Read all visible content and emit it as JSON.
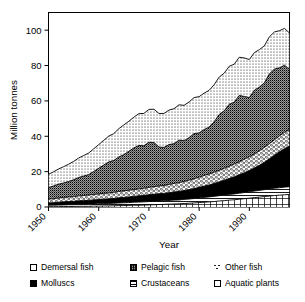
{
  "chart_data": {
    "type": "area",
    "title": "",
    "xlabel": "Year",
    "ylabel": "Million tonnes",
    "xlim": [
      1950,
      1998
    ],
    "ylim": [
      0,
      110
    ],
    "yticks": [
      0,
      20,
      40,
      60,
      80,
      100
    ],
    "xticks": [
      1950,
      1960,
      1970,
      1980,
      1990
    ],
    "grid": false,
    "legend_position": "below",
    "stacked": true,
    "stack_order_bottom_to_top": [
      "Aquatic plants",
      "Crustaceans",
      "Molluscs",
      "Other fish",
      "Pelagic fish",
      "Demersal fish"
    ],
    "x": [
      1950,
      1951,
      1952,
      1953,
      1954,
      1955,
      1956,
      1957,
      1958,
      1959,
      1960,
      1961,
      1962,
      1963,
      1964,
      1965,
      1966,
      1967,
      1968,
      1969,
      1970,
      1971,
      1972,
      1973,
      1974,
      1975,
      1976,
      1977,
      1978,
      1979,
      1980,
      1981,
      1982,
      1983,
      1984,
      1985,
      1986,
      1987,
      1988,
      1989,
      1990,
      1991,
      1992,
      1993,
      1994,
      1995,
      1996,
      1997,
      1998
    ],
    "series": [
      {
        "name": "Aquatic plants",
        "values": [
          0.2,
          0.2,
          0.2,
          0.3,
          0.3,
          0.3,
          0.4,
          0.4,
          0.4,
          0.5,
          0.5,
          0.6,
          0.6,
          0.7,
          0.8,
          0.8,
          0.9,
          1.0,
          1.0,
          1.1,
          1.2,
          1.3,
          1.4,
          1.5,
          1.6,
          1.7,
          1.8,
          2.0,
          2.1,
          2.3,
          2.5,
          2.7,
          2.9,
          3.1,
          3.4,
          3.6,
          3.9,
          4.1,
          4.4,
          4.7,
          5.0,
          5.3,
          5.6,
          5.9,
          6.2,
          6.5,
          6.7,
          6.9,
          7.1
        ]
      },
      {
        "name": "Crustaceans",
        "values": [
          0.8,
          0.8,
          0.9,
          0.9,
          1.0,
          1.0,
          1.1,
          1.1,
          1.2,
          1.2,
          1.3,
          1.3,
          1.4,
          1.4,
          1.5,
          1.6,
          1.6,
          1.7,
          1.8,
          1.8,
          1.9,
          1.9,
          2.0,
          2.0,
          2.1,
          2.2,
          2.2,
          2.3,
          2.4,
          2.5,
          2.6,
          2.7,
          2.8,
          2.9,
          3.0,
          3.1,
          3.2,
          3.3,
          3.4,
          3.5,
          3.6,
          3.7,
          3.8,
          3.9,
          4.0,
          4.1,
          4.2,
          4.3,
          4.4
        ]
      },
      {
        "name": "Molluscs",
        "values": [
          1.3,
          1.4,
          1.6,
          1.7,
          1.8,
          1.9,
          2.0,
          2.1,
          2.2,
          2.3,
          2.4,
          2.5,
          2.6,
          2.7,
          2.9,
          3.0,
          3.2,
          3.3,
          3.5,
          3.6,
          3.8,
          4.0,
          4.1,
          4.2,
          4.4,
          4.6,
          4.8,
          5.0,
          5.3,
          5.6,
          6.0,
          6.4,
          6.8,
          7.3,
          7.8,
          8.4,
          9.0,
          9.7,
          10.4,
          11.2,
          12.0,
          13.0,
          14.2,
          15.5,
          17.0,
          18.6,
          20.3,
          21.8,
          23.0
        ]
      },
      {
        "name": "Other fish",
        "values": [
          2.2,
          2.3,
          2.4,
          2.5,
          2.6,
          2.7,
          2.8,
          2.9,
          3.0,
          3.1,
          3.2,
          3.3,
          3.4,
          3.5,
          3.6,
          3.7,
          3.8,
          3.9,
          4.0,
          4.1,
          4.2,
          4.3,
          4.4,
          4.5,
          4.7,
          4.8,
          5.0,
          5.2,
          5.4,
          5.6,
          5.8,
          6.0,
          6.2,
          6.4,
          6.6,
          6.8,
          7.0,
          7.2,
          7.4,
          7.6,
          7.8,
          8.0,
          8.2,
          8.4,
          8.6,
          8.8,
          9.0,
          9.2,
          9.4
        ]
      },
      {
        "name": "Pelagic fish",
        "values": [
          6.5,
          7.2,
          7.8,
          8.2,
          8.7,
          9.5,
          10.4,
          11.0,
          11.5,
          13.0,
          14.5,
          16.0,
          17.5,
          18.0,
          19.5,
          20.5,
          22.0,
          23.5,
          24.5,
          24.0,
          25.5,
          25.0,
          22.0,
          21.5,
          22.5,
          22.5,
          24.0,
          23.0,
          24.0,
          25.5,
          25.0,
          26.0,
          26.5,
          28.5,
          31.5,
          32.5,
          35.0,
          35.0,
          37.5,
          35.5,
          33.5,
          36.0,
          36.0,
          36.5,
          39.5,
          40.0,
          38.5,
          38.0,
          34.0
        ]
      },
      {
        "name": "Demersal fish",
        "values": [
          7.5,
          8.0,
          8.6,
          9.2,
          9.8,
          10.4,
          11.0,
          11.6,
          12.2,
          12.8,
          13.4,
          14.0,
          14.6,
          15.2,
          16.0,
          16.8,
          17.0,
          17.4,
          18.0,
          18.3,
          18.6,
          18.8,
          19.0,
          19.2,
          19.5,
          19.8,
          20.0,
          20.0,
          20.2,
          20.4,
          20.5,
          20.6,
          20.8,
          21.0,
          21.2,
          21.3,
          21.5,
          21.5,
          21.6,
          21.8,
          21.5,
          21.3,
          21.2,
          21.0,
          21.0,
          21.0,
          21.0,
          20.8,
          20.5
        ]
      }
    ],
    "total_peak": 105,
    "total_at_start": 18.5,
    "total_at_end": 98.4
  },
  "legend": {
    "items": [
      {
        "label": "Demersal fish",
        "pattern": "light-dotted",
        "swatch_class": "sw-demersal"
      },
      {
        "label": "Pelagic fish",
        "pattern": "dark-checkered",
        "swatch_class": "sw-pelagic"
      },
      {
        "label": "Other fish",
        "pattern": "sparse-dots",
        "swatch_class": "sw-otherfish"
      },
      {
        "label": "Molluscs",
        "pattern": "solid-black",
        "swatch_class": "sw-molluscs"
      },
      {
        "label": "Crustaceans",
        "pattern": "horizontal-lines",
        "swatch_class": "sw-crustaceans"
      },
      {
        "label": "Aquatic plants",
        "pattern": "white-empty",
        "swatch_class": "sw-aquatic"
      }
    ]
  },
  "axes": {
    "y_title": "Million tonnes",
    "x_title": "Year",
    "y_tick_labels": [
      "0",
      "20",
      "40",
      "60",
      "80",
      "100"
    ],
    "x_tick_labels": [
      "1950",
      "1960",
      "1970",
      "1980",
      "1990"
    ]
  },
  "colors": {
    "line": "#000000",
    "axis": "#000000",
    "background": "#ffffff",
    "molluscs_fill": "#000000",
    "pelagic_fill": "#7d7d7d"
  }
}
